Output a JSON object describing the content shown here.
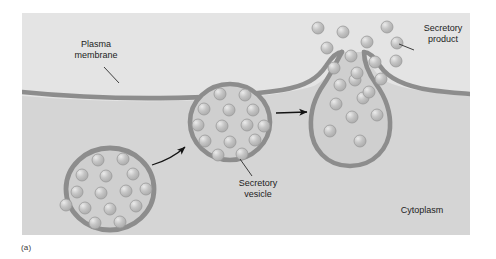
{
  "figure": {
    "caption": "(a)",
    "panel": {
      "x": 22,
      "y": 13,
      "width": 448,
      "height": 222,
      "background_color": "#dddddd"
    },
    "background_color": "#ffffff",
    "title_visible": false
  },
  "colors": {
    "panel_fill": "#dcdcdc",
    "extracellular_fill": "#e3e3e3",
    "cytoplasm_fill": "#d6d6d6",
    "membrane_stroke": "#8e8e8e",
    "vesicle_fill": "#cfcfcf",
    "granule_fill": "#bdbdbd",
    "granule_highlight": "#e6e6e6",
    "text_color": "#1c1c1c",
    "arrow_color": "#141414",
    "leader_color": "#2b2b2b"
  },
  "labels": [
    {
      "id": "plasma-membrane",
      "lines": [
        "Plasma",
        "membrane"
      ],
      "x": 96,
      "y": 52,
      "anchor": "middle",
      "font_size": 9,
      "leader": {
        "x1": 104,
        "y1": 66,
        "x2": 118,
        "y2": 82
      }
    },
    {
      "id": "secretory-product",
      "lines": [
        "Secretory",
        "product"
      ],
      "x": 443,
      "y": 33,
      "anchor": "middle",
      "font_size": 9,
      "leader": {
        "x1": 412,
        "y1": 50,
        "x2": 397,
        "y2": 43
      }
    },
    {
      "id": "secretory-vesicle",
      "lines": [
        "Secretory",
        "vesicle"
      ],
      "x": 258,
      "y": 184,
      "anchor": "middle",
      "font_size": 9,
      "leader": {
        "x1": 251,
        "y1": 175,
        "x2": 239,
        "y2": 160
      }
    },
    {
      "id": "cytoplasm",
      "lines": [
        "Cytoplasm"
      ],
      "x": 422,
      "y": 212,
      "anchor": "middle",
      "font_size": 9,
      "leader": null
    }
  ],
  "arrows": [
    {
      "id": "arrow-vesicle-migration",
      "type": "curved",
      "path": "M 152,165 Q 172,158 186,146",
      "from": "left-vesicle",
      "to": "middle-vesicle"
    },
    {
      "id": "arrow-vesicle-fusion",
      "type": "straight",
      "path": "M 276,113 L 310,112",
      "from": "middle-vesicle",
      "to": "fusing-vesicle"
    }
  ],
  "vesicles": [
    {
      "id": "left-vesicle",
      "name": "free-secretory-vesicle",
      "cx": 110,
      "cy": 189,
      "rx": 46,
      "ry": 43,
      "granule_count": 15,
      "granules": [
        {
          "cx": 98,
          "cy": 160,
          "r": 6
        },
        {
          "cx": 123,
          "cy": 159,
          "r": 6
        },
        {
          "cx": 82,
          "cy": 175,
          "r": 6
        },
        {
          "cx": 106,
          "cy": 176,
          "r": 6
        },
        {
          "cx": 133,
          "cy": 174,
          "r": 6
        },
        {
          "cx": 77,
          "cy": 192,
          "r": 6
        },
        {
          "cx": 101,
          "cy": 193,
          "r": 6
        },
        {
          "cx": 126,
          "cy": 191,
          "r": 6
        },
        {
          "cx": 85,
          "cy": 208,
          "r": 6
        },
        {
          "cx": 110,
          "cy": 209,
          "r": 6
        },
        {
          "cx": 136,
          "cy": 206,
          "r": 6
        },
        {
          "cx": 95,
          "cy": 223,
          "r": 6
        },
        {
          "cx": 120,
          "cy": 222,
          "r": 6
        },
        {
          "cx": 146,
          "cy": 189,
          "r": 6
        },
        {
          "cx": 66,
          "cy": 205,
          "r": 6
        }
      ]
    },
    {
      "id": "middle-vesicle",
      "name": "docking-secretory-vesicle",
      "cx": 230,
      "cy": 122,
      "rx": 42,
      "ry": 40,
      "granule_count": 14,
      "granules": [
        {
          "cx": 220,
          "cy": 94,
          "r": 6
        },
        {
          "cx": 245,
          "cy": 95,
          "r": 6
        },
        {
          "cx": 204,
          "cy": 109,
          "r": 6
        },
        {
          "cx": 229,
          "cy": 110,
          "r": 6
        },
        {
          "cx": 253,
          "cy": 110,
          "r": 6
        },
        {
          "cx": 198,
          "cy": 125,
          "r": 6
        },
        {
          "cx": 222,
          "cy": 126,
          "r": 6
        },
        {
          "cx": 247,
          "cy": 125,
          "r": 6
        },
        {
          "cx": 205,
          "cy": 141,
          "r": 6
        },
        {
          "cx": 230,
          "cy": 142,
          "r": 6
        },
        {
          "cx": 255,
          "cy": 140,
          "r": 6
        },
        {
          "cx": 218,
          "cy": 155,
          "r": 6
        },
        {
          "cx": 242,
          "cy": 154,
          "r": 6
        },
        {
          "cx": 264,
          "cy": 126,
          "r": 6
        }
      ]
    },
    {
      "id": "fusing-vesicle",
      "name": "fusing-secretory-vesicle",
      "cx": 350,
      "cy": 128,
      "rx": 38,
      "ry": 36,
      "granule_count": 7,
      "granules": [
        {
          "cx": 355,
          "cy": 80,
          "r": 6
        },
        {
          "cx": 363,
          "cy": 98,
          "r": 6
        },
        {
          "cx": 336,
          "cy": 104,
          "r": 6
        },
        {
          "cx": 377,
          "cy": 115,
          "r": 6
        },
        {
          "cx": 352,
          "cy": 117,
          "r": 6
        },
        {
          "cx": 330,
          "cy": 131,
          "r": 6
        },
        {
          "cx": 360,
          "cy": 141,
          "r": 6
        }
      ]
    }
  ],
  "secretory_products": {
    "name": "released-secretory-product-granules",
    "count": 14,
    "granules": [
      {
        "cx": 343,
        "cy": 32,
        "r": 6
      },
      {
        "cx": 387,
        "cy": 27,
        "r": 6
      },
      {
        "cx": 327,
        "cy": 48,
        "r": 6
      },
      {
        "cx": 367,
        "cy": 42,
        "r": 6
      },
      {
        "cx": 393,
        "cy": 43,
        "r": 6
      },
      {
        "cx": 351,
        "cy": 56,
        "r": 6
      },
      {
        "cx": 375,
        "cy": 62,
        "r": 6
      },
      {
        "cx": 334,
        "cy": 68,
        "r": 6
      },
      {
        "cx": 396,
        "cy": 61,
        "r": 6
      },
      {
        "cx": 357,
        "cy": 73,
        "r": 6
      },
      {
        "cx": 318,
        "cy": 28,
        "r": 6
      },
      {
        "cx": 381,
        "cy": 79,
        "r": 6
      },
      {
        "cx": 340,
        "cy": 85,
        "r": 6
      },
      {
        "cx": 369,
        "cy": 92,
        "r": 6
      }
    ]
  }
}
